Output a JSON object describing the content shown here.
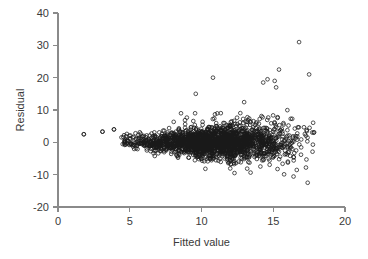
{
  "chart_data": {
    "type": "scatter",
    "title": "",
    "xlabel": "Fitted value",
    "ylabel": "Residual",
    "xlim": [
      0,
      20
    ],
    "ylim": [
      -20,
      40
    ],
    "xticks": [
      0,
      5,
      10,
      15,
      20
    ],
    "yticks": [
      -20,
      -10,
      0,
      10,
      20,
      30,
      40
    ],
    "xtick_labels": [
      "0",
      "5",
      "10",
      "15",
      "20"
    ],
    "ytick_labels": [
      "-20",
      "-10",
      "0",
      "10",
      "20",
      "30",
      "40"
    ],
    "grid": false,
    "legend": null,
    "marker": "open-circle",
    "marker_color": "#1a1a1a",
    "axis_color": "#8a8a8a",
    "n_points": 2100,
    "notable_outliers": [
      {
        "x": 16.8,
        "y": 31.0
      },
      {
        "x": 17.5,
        "y": 21.0
      },
      {
        "x": 15.4,
        "y": 22.5
      },
      {
        "x": 10.8,
        "y": 20.0
      },
      {
        "x": 14.6,
        "y": 19.5
      },
      {
        "x": 14.3,
        "y": 18.5
      },
      {
        "x": 15.1,
        "y": 19.0
      },
      {
        "x": 15.2,
        "y": 17.0
      },
      {
        "x": 9.6,
        "y": 15.0
      },
      {
        "x": 1.8,
        "y": 2.5
      },
      {
        "x": 3.1,
        "y": 3.3
      },
      {
        "x": 3.9,
        "y": 4.0
      },
      {
        "x": 17.4,
        "y": -12.5
      },
      {
        "x": 12.3,
        "y": -9.5
      }
    ],
    "series": [
      {
        "name": "residuals",
        "spread_model": "sd grows from about 1.0 at fitted 4.5 to about 4.5 at fitted 17.5",
        "x_range": [
          1.8,
          17.8
        ],
        "y_range": [
          -12.5,
          31.0
        ]
      }
    ]
  },
  "axes": {
    "y": {
      "label": "Residual",
      "ticks": [
        {
          "value": 40,
          "label": "40"
        },
        {
          "value": 30,
          "label": "30"
        },
        {
          "value": 20,
          "label": "20"
        },
        {
          "value": 10,
          "label": "10"
        },
        {
          "value": 0,
          "label": "0"
        },
        {
          "value": -10,
          "label": "-10"
        },
        {
          "value": -20,
          "label": "-20"
        }
      ]
    },
    "x": {
      "label": "Fitted value",
      "ticks": [
        {
          "value": 0,
          "label": "0"
        },
        {
          "value": 5,
          "label": "5"
        },
        {
          "value": 10,
          "label": "10"
        },
        {
          "value": 15,
          "label": "15"
        },
        {
          "value": 20,
          "label": "20"
        }
      ]
    }
  }
}
